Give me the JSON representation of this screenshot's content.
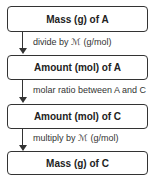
{
  "flowchart": {
    "boxes": [
      {
        "label": "Mass (g) of A"
      },
      {
        "label": "Amount (mol) of A"
      },
      {
        "label": "Amount (mol) of C"
      },
      {
        "label": "Mass (g) of C"
      }
    ],
    "steps": [
      {
        "label": "divide by ℳ (g/mol)"
      },
      {
        "label": "molar ratio between A and C"
      },
      {
        "label": "multiply by ℳ (g/mol)"
      }
    ]
  }
}
